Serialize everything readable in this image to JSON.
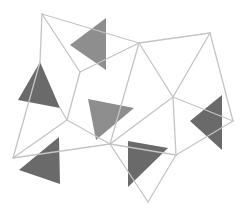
{
  "illustration": {
    "title": "Low-poly geometric wireframe with gray triangles",
    "background": "#ffffff",
    "line_color": "#c4c4c4",
    "triangle_colors": {
      "medium": "#8e8e8e",
      "dark": "#6a6a6a"
    },
    "triangles": [
      {
        "name": "triangle-top",
        "points": "106,18 70,45 106,70",
        "tone": "medium"
      },
      {
        "name": "triangle-left",
        "points": "40,62 18,100 60,108",
        "tone": "dark"
      },
      {
        "name": "triangle-center",
        "points": "88,99 134,108 96,140",
        "tone": "medium"
      },
      {
        "name": "triangle-bottom-left",
        "points": "59,137 19,170 60,184",
        "tone": "dark"
      },
      {
        "name": "triangle-bottom-center",
        "points": "128,141 168,148 128,187",
        "tone": "dark"
      },
      {
        "name": "triangle-right",
        "points": "222,95 190,121 222,150",
        "tone": "dark"
      }
    ],
    "mesh_lines": [
      "42,14 139,43",
      "42,14 40,62",
      "42,14 80,72",
      "139,43 210,33",
      "139,43 80,72",
      "139,43 110,144",
      "139,43 173,97",
      "210,33 173,97",
      "210,33 233,121",
      "80,72 67,120",
      "67,120 13,158",
      "67,120 110,144",
      "40,62 13,158",
      "13,158 110,144",
      "110,144 173,97",
      "110,144 176,155",
      "110,144 148,202",
      "173,97 176,155",
      "173,97 233,121",
      "176,155 233,121",
      "176,155 148,202",
      "67,120 60,108"
    ]
  }
}
